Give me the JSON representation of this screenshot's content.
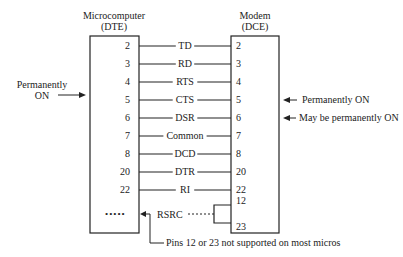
{
  "dte": {
    "title": "Microcomputer",
    "subtitle": "(DTE)"
  },
  "dce": {
    "title": "Modem",
    "subtitle": "(DCE)"
  },
  "signals": [
    {
      "dte_pin": "2",
      "name": "TD",
      "dce_pin": "2",
      "y": 46
    },
    {
      "dte_pin": "3",
      "name": "RD",
      "dce_pin": "3",
      "y": 64
    },
    {
      "dte_pin": "4",
      "name": "RTS",
      "dce_pin": "4",
      "y": 82
    },
    {
      "dte_pin": "5",
      "name": "CTS",
      "dce_pin": "5",
      "y": 100
    },
    {
      "dte_pin": "6",
      "name": "DSR",
      "dce_pin": "6",
      "y": 118
    },
    {
      "dte_pin": "7",
      "name": "Common",
      "dce_pin": "7",
      "y": 136
    },
    {
      "dte_pin": "8",
      "name": "DCD",
      "dce_pin": "8",
      "y": 154
    },
    {
      "dte_pin": "20",
      "name": "DTR",
      "dce_pin": "20",
      "y": 172
    },
    {
      "dte_pin": "22",
      "name": "RI",
      "dce_pin": "22",
      "y": 190
    }
  ],
  "rsrc": {
    "label": "RSRC",
    "dots": "•••••",
    "dce_pins": [
      "12",
      "23"
    ]
  },
  "annotations": {
    "left_note_line1": "Permanently",
    "left_note_line2": "ON",
    "cts_note": "Permanently ON",
    "dsr_note": "May be permanently ON",
    "footnote": "Pins 12 or 23 not supported on most micros"
  }
}
